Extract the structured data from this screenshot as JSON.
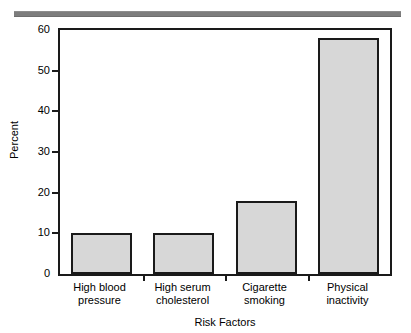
{
  "figure": {
    "background_color": "#ffffff",
    "rule_color": "#7d7d7d",
    "frame_color": "#1a1a1a",
    "bar_fill_color": "#d7d7d7",
    "bar_edge_color": "#1a1a1a"
  },
  "chart_data": {
    "type": "bar",
    "title": "",
    "xlabel": "Risk Factors",
    "ylabel": "Percent",
    "categories": [
      "High blood pressure",
      "High serum cholesterol",
      "Cigarette smoking",
      "Physical inactivity"
    ],
    "category_lines": [
      [
        "High blood",
        "pressure"
      ],
      [
        "High serum",
        "cholesterol"
      ],
      [
        "Cigarette",
        "smoking"
      ],
      [
        "Physical",
        "inactivity"
      ]
    ],
    "values": [
      10,
      10,
      18,
      58
    ],
    "ylim": [
      0,
      60
    ],
    "yticks": [
      0,
      10,
      20,
      30,
      40,
      50,
      60
    ],
    "ytick_labels": [
      "0",
      "10",
      "20",
      "30",
      "40",
      "50",
      "60"
    ],
    "grid": false,
    "legend": false
  }
}
